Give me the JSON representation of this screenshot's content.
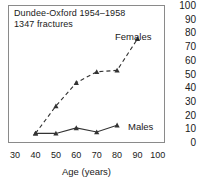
{
  "figure": {
    "annotation_line1": "Dundee-Oxford 1954–1958",
    "annotation_line2": "1347 fractures"
  },
  "chart_data": {
    "type": "line",
    "title": "Dundee-Oxford 1954–1958",
    "subtitle": "1347 fractures",
    "xlabel": "Age (years)",
    "ylabel": "",
    "xlim": [
      30,
      100
    ],
    "ylim": [
      0,
      100
    ],
    "xticks": [
      30,
      40,
      50,
      60,
      70,
      80,
      90,
      100
    ],
    "yticks": [
      0,
      10,
      20,
      30,
      40,
      50,
      60,
      70,
      80,
      90,
      100
    ],
    "y_axis_position": "right",
    "grid": false,
    "legend": "inline-labels",
    "marker": "triangle",
    "series": [
      {
        "name": "Females",
        "linestyle": "dashed",
        "color": "#333333",
        "x": [
          40,
          50,
          60,
          70,
          80,
          90
        ],
        "values": [
          7,
          27,
          44,
          52,
          53,
          76
        ]
      },
      {
        "name": "Males",
        "linestyle": "solid",
        "color": "#333333",
        "x": [
          40,
          50,
          60,
          70,
          80
        ],
        "values": [
          7,
          7,
          11,
          8,
          13
        ]
      }
    ]
  },
  "axes": {
    "y_tick_labels": [
      "100",
      "90",
      "80",
      "70",
      "60",
      "50",
      "40",
      "30",
      "20",
      "10",
      "0"
    ],
    "x_tick_labels": [
      "30",
      "40",
      "50",
      "60",
      "70",
      "80",
      "90",
      "100"
    ],
    "x_axis_title": "Age (years)"
  },
  "colors": {
    "frame": "#8a8a8a",
    "line": "#333333",
    "text": "#1a1a1a",
    "background": "#ffffff"
  }
}
